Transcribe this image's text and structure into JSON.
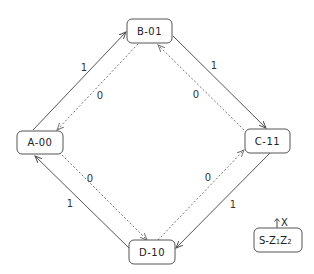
{
  "states": [
    {
      "id": "A",
      "label": "A-00"
    },
    {
      "id": "B",
      "label": "B-01"
    },
    {
      "id": "C",
      "label": "C-11"
    },
    {
      "id": "D",
      "label": "D-10"
    }
  ],
  "transitions": [
    {
      "from": "A",
      "to": "B",
      "input": "1",
      "style": "solid"
    },
    {
      "from": "B",
      "to": "A",
      "input": "0",
      "style": "dotted"
    },
    {
      "from": "B",
      "to": "C",
      "input": "1",
      "style": "solid"
    },
    {
      "from": "C",
      "to": "B",
      "input": "0",
      "style": "dotted"
    },
    {
      "from": "C",
      "to": "D",
      "input": "1",
      "style": "solid"
    },
    {
      "from": "D",
      "to": "C",
      "input": "0",
      "style": "dotted"
    },
    {
      "from": "D",
      "to": "A",
      "input": "1",
      "style": "solid"
    },
    {
      "from": "A",
      "to": "D",
      "input": "0",
      "style": "dotted"
    }
  ],
  "legend": {
    "input_label": "X",
    "state_label": "S-",
    "output_vars": [
      {
        "base": "Z",
        "sub": "1"
      },
      {
        "base": "Z",
        "sub": "2"
      }
    ]
  }
}
